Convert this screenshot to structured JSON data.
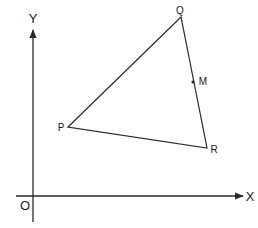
{
  "diagram": {
    "type": "coordinate-geometry",
    "colors": {
      "background": "#ffffff",
      "stroke": "#2a2a2a",
      "text": "#1a1a1a"
    },
    "axes": {
      "x_label": "X",
      "y_label": "Y",
      "origin_label": "O"
    },
    "points": {
      "P": {
        "label": "P"
      },
      "Q": {
        "label": "Q"
      },
      "R": {
        "label": "R"
      },
      "M": {
        "label": "M",
        "on_segment": "QR"
      }
    },
    "triangle": [
      "P",
      "Q",
      "R"
    ]
  }
}
